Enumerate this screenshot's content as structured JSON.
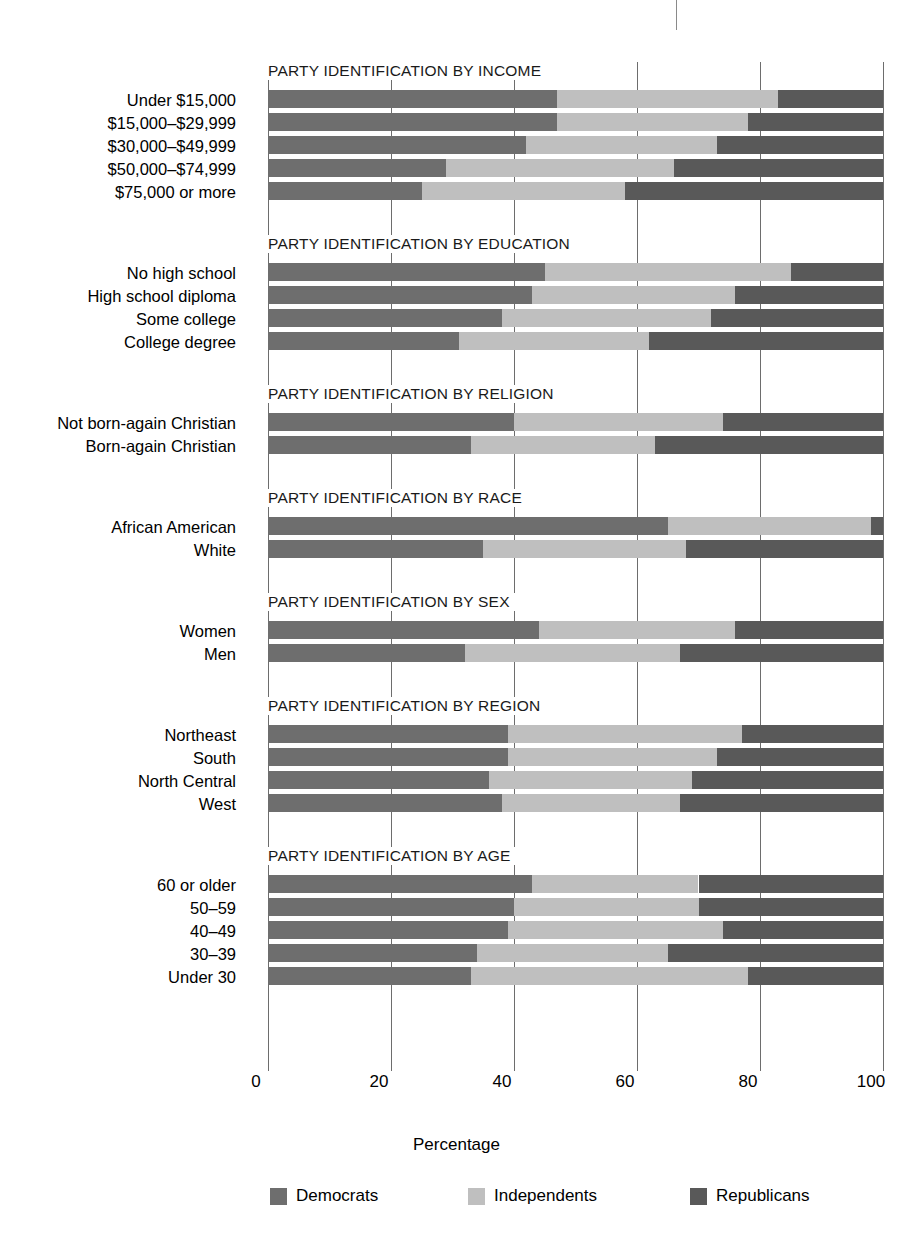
{
  "chart_data": {
    "type": "bar",
    "subtype": "stacked-horizontal-100pct",
    "title": "",
    "xlabel": "Percentage",
    "ylabel": "",
    "xlim": [
      0,
      100
    ],
    "xticks": [
      0,
      20,
      40,
      60,
      80,
      100
    ],
    "xtick_labels": [
      "0",
      "20",
      "40",
      "60",
      "80",
      "100"
    ],
    "grid": "vertical",
    "legend_position": "bottom",
    "series_names": [
      "Democrats",
      "Independents",
      "Republicans"
    ],
    "series_colors": [
      "#6e6e6e",
      "#bfbfbf",
      "#595959"
    ],
    "groups": [
      {
        "title": "PARTY IDENTIFICATION BY INCOME",
        "categories": [
          "Under $15,000",
          "$15,000–$29,999",
          "$30,000–$49,999",
          "$50,000–$74,999",
          "$75,000 or more"
        ],
        "series": [
          {
            "name": "Democrats",
            "values": [
              47,
              47,
              42,
              29,
              25
            ]
          },
          {
            "name": "Independents",
            "values": [
              36,
              31,
              31,
              37,
              33
            ]
          },
          {
            "name": "Republicans",
            "values": [
              17,
              22,
              27,
              34,
              42
            ]
          }
        ]
      },
      {
        "title": "PARTY IDENTIFICATION BY EDUCATION",
        "categories": [
          "No high school",
          "High school diploma",
          "Some college",
          "College degree"
        ],
        "series": [
          {
            "name": "Democrats",
            "values": [
              45,
              43,
              38,
              31
            ]
          },
          {
            "name": "Independents",
            "values": [
              40,
              33,
              34,
              31
            ]
          },
          {
            "name": "Republicans",
            "values": [
              15,
              24,
              28,
              38
            ]
          }
        ]
      },
      {
        "title": "PARTY IDENTIFICATION BY RELIGION",
        "categories": [
          "Not born-again Christian",
          "Born-again Christian"
        ],
        "series": [
          {
            "name": "Democrats",
            "values": [
              40,
              33
            ]
          },
          {
            "name": "Independents",
            "values": [
              34,
              30
            ]
          },
          {
            "name": "Republicans",
            "values": [
              26,
              37
            ]
          }
        ]
      },
      {
        "title": "PARTY IDENTIFICATION BY RACE",
        "categories": [
          "African American",
          "White"
        ],
        "series": [
          {
            "name": "Democrats",
            "values": [
              65,
              35
            ]
          },
          {
            "name": "Independents",
            "values": [
              33,
              33
            ]
          },
          {
            "name": "Republicans",
            "values": [
              2,
              32
            ]
          }
        ]
      },
      {
        "title": "PARTY IDENTIFICATION BY SEX",
        "categories": [
          "Women",
          "Men"
        ],
        "series": [
          {
            "name": "Democrats",
            "values": [
              44,
              32
            ]
          },
          {
            "name": "Independents",
            "values": [
              32,
              35
            ]
          },
          {
            "name": "Republicans",
            "values": [
              24,
              33
            ]
          }
        ]
      },
      {
        "title": "PARTY IDENTIFICATION BY REGION",
        "categories": [
          "Northeast",
          "South",
          "North Central",
          "West"
        ],
        "series": [
          {
            "name": "Democrats",
            "values": [
              39,
              39,
              36,
              38
            ]
          },
          {
            "name": "Independents",
            "values": [
              38,
              34,
              33,
              29
            ]
          },
          {
            "name": "Republicans",
            "values": [
              23,
              27,
              31,
              33
            ]
          }
        ]
      },
      {
        "title": "PARTY IDENTIFICATION BY AGE",
        "categories": [
          "60 or older",
          "50–59",
          "40–49",
          "30–39",
          "Under 30"
        ],
        "series": [
          {
            "name": "Democrats",
            "values": [
              43,
              40,
              39,
              34,
              33
            ]
          },
          {
            "name": "Independents",
            "values": [
              27,
              30,
              35,
              31,
              45
            ]
          },
          {
            "name": "Republicans",
            "values": [
              30,
              30,
              26,
              35,
              22
            ]
          }
        ]
      }
    ]
  },
  "axis": {
    "x_title": "Percentage",
    "tick_labels": [
      "0",
      "20",
      "40",
      "60",
      "80",
      "100"
    ]
  },
  "legend": {
    "items": [
      {
        "label": "Democrats",
        "color": "#6e6e6e"
      },
      {
        "label": "Independents",
        "color": "#bfbfbf"
      },
      {
        "label": "Republicans",
        "color": "#595959"
      }
    ]
  }
}
